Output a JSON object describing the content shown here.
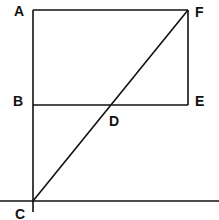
{
  "diagram": {
    "points": {
      "A": {
        "label": "A",
        "x": 33,
        "y": 10
      },
      "B": {
        "label": "B",
        "x": 33,
        "y": 105
      },
      "C": {
        "label": "C",
        "x": 33,
        "y": 201
      },
      "D": {
        "label": "D",
        "x": 110,
        "y": 105
      },
      "E": {
        "label": "E",
        "x": 188,
        "y": 105
      },
      "F": {
        "label": "F",
        "x": 188,
        "y": 10
      }
    },
    "segments": [
      "AF",
      "FE",
      "BE",
      "AC",
      "CF",
      "baseline"
    ],
    "stroke_color": "#111111"
  }
}
